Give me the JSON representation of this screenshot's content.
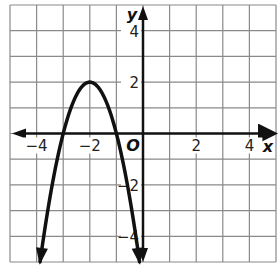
{
  "chart_data": {
    "type": "line",
    "title": "",
    "xlabel": "x",
    "ylabel": "y",
    "origin_label": "O",
    "xlim": [
      -5,
      5
    ],
    "ylim": [
      -5,
      5
    ],
    "grid": true,
    "grid_step": 1,
    "x_tick_labels": [
      "−4",
      "−2",
      "2",
      "4"
    ],
    "x_tick_values": [
      -4,
      -2,
      2,
      4
    ],
    "y_tick_labels": [
      "4",
      "2",
      "−2",
      "−4"
    ],
    "y_tick_values": [
      4,
      2,
      -2,
      -4
    ],
    "series": [
      {
        "name": "parabola",
        "equation": "y = -2(x + 2)^2 + 2",
        "vertex": [
          -2,
          2
        ],
        "x_intercepts": [
          -3,
          -1
        ],
        "end_behavior": "arrows pointing down at both ends",
        "x": [
          -3.87,
          -3.5,
          -3,
          -2.5,
          -2,
          -1.5,
          -1,
          -0.5,
          -0.13
        ],
        "values": [
          -5,
          -2.5,
          0,
          1.5,
          2,
          1.5,
          0,
          -2.5,
          -5
        ]
      }
    ],
    "legend": "none"
  },
  "colors": {
    "grid": "#8a8a8a",
    "axis": "#111111",
    "curve": "#111111",
    "background": "#ffffff"
  }
}
